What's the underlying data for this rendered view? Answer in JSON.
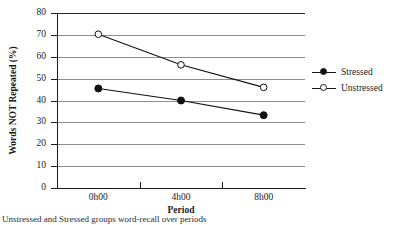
{
  "chart_data": {
    "type": "line",
    "title": "",
    "subtitle": "",
    "xlabel": "Period",
    "ylabel": "Words NOT Repeated (%)",
    "categories": [
      "0h00",
      "4h00",
      "8h00"
    ],
    "xtick_labels": [
      "0h00",
      "4h00",
      "8h00"
    ],
    "ytick_labels": [
      "0",
      "10",
      "20",
      "30",
      "40",
      "50",
      "60",
      "70",
      "80"
    ],
    "ytick_values": [
      0,
      10,
      20,
      30,
      40,
      50,
      60,
      70,
      80
    ],
    "ylim": [
      0,
      80
    ],
    "grid": "horizontal",
    "legend_position": "right-outside",
    "series": [
      {
        "name": "Stressed",
        "marker": "filled-circle",
        "line": "solid",
        "color": "#111111",
        "values": [
          45.5,
          40.0,
          33.3
        ]
      },
      {
        "name": "Unstressed",
        "marker": "open-circle",
        "line": "solid",
        "color": "#111111",
        "values": [
          70.3,
          56.3,
          46.0
        ]
      }
    ],
    "legend": [
      "Stressed",
      "Unstressed"
    ]
  },
  "legend": {
    "items": [
      {
        "label": "Stressed",
        "marker": "filled-circle"
      },
      {
        "label": "Unstressed",
        "marker": "open-circle"
      }
    ]
  },
  "caption": {
    "clipped_line": "Unstressed and Stressed groups word-recall over periods"
  },
  "colors": {
    "axis": "#1a1a1a",
    "gridline": "#8d8d8d",
    "series": "#111111",
    "background": "#ffffff"
  }
}
